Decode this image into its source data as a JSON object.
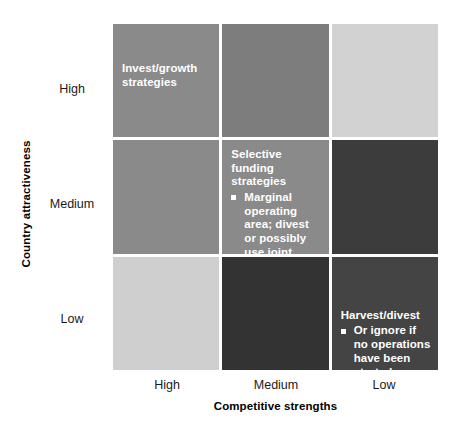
{
  "chart_data": {
    "type": "heatmap",
    "title": "",
    "xlabel": "Competitive strengths",
    "ylabel": "Country attractiveness",
    "x_categories": [
      "High",
      "Medium",
      "Low"
    ],
    "y_categories": [
      "High",
      "Medium",
      "Low"
    ],
    "grid": true,
    "legend": "none",
    "cells": [
      {
        "row": "High",
        "col": "High",
        "color": "#8a8a8a",
        "shade_value": 3,
        "text_position": "middle",
        "title": "Invest/growth strategies",
        "bullets": []
      },
      {
        "row": "High",
        "col": "Medium",
        "color": "#7d7d7d",
        "shade_value": 3,
        "text_position": "middle",
        "title": "",
        "bullets": []
      },
      {
        "row": "High",
        "col": "Low",
        "color": "#d2d2d2",
        "shade_value": 1,
        "text_position": "middle",
        "title": "",
        "bullets": []
      },
      {
        "row": "Medium",
        "col": "High",
        "color": "#8a8a8a",
        "shade_value": 3,
        "text_position": "middle",
        "title": "",
        "bullets": []
      },
      {
        "row": "Medium",
        "col": "Medium",
        "color": "#8a8a8a",
        "shade_value": 3,
        "text_position": "top",
        "title": "Selective funding strategies",
        "bullets": [
          "Marginal operating area; divest or possibly use joint venture to enter market"
        ]
      },
      {
        "row": "Medium",
        "col": "Low",
        "color": "#3c3c3c",
        "shade_value": 5,
        "text_position": "middle",
        "title": "",
        "bullets": []
      },
      {
        "row": "Low",
        "col": "High",
        "color": "#cfcfcf",
        "shade_value": 1,
        "text_position": "middle",
        "title": "",
        "bullets": []
      },
      {
        "row": "Low",
        "col": "Medium",
        "color": "#333333",
        "shade_value": 6,
        "text_position": "middle",
        "title": "",
        "bullets": []
      },
      {
        "row": "Low",
        "col": "Low",
        "color": "#444444",
        "shade_value": 5,
        "text_position": "low",
        "title": "Harvest/divest",
        "bullets": [
          "Or ignore if no operations have been started"
        ]
      }
    ]
  },
  "axes": {
    "y_title": "Country attractiveness",
    "x_title": "Competitive strengths",
    "y_ticks": [
      "High",
      "Medium",
      "Low"
    ],
    "x_ticks": [
      "High",
      "Medium",
      "Low"
    ]
  },
  "colors": {
    "background": "#ffffff",
    "text_dark": "#1a1a1a",
    "text_light": "#ffffff",
    "grid_gap": "#ffffff"
  }
}
